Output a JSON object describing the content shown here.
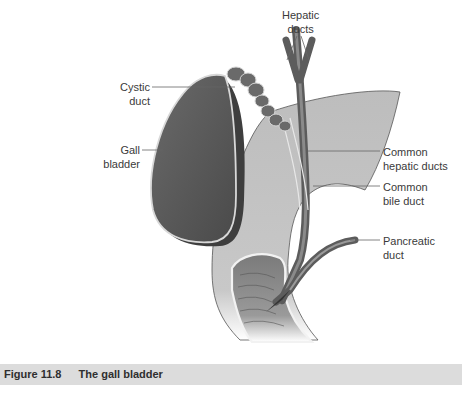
{
  "figure": {
    "labels": {
      "hepatic_ducts": [
        "Hepatic",
        "ducts"
      ],
      "cystic_duct": [
        "Cystic",
        "duct"
      ],
      "gall_bladder": [
        "Gall",
        "bladder"
      ],
      "common_hepatic_ducts": [
        "Common",
        "hepatic ducts"
      ],
      "common_bile_duct": [
        "Common",
        "bile duct"
      ],
      "pancreatic_duct": [
        "Pancreatic",
        "duct"
      ]
    },
    "colors": {
      "gallbladder": "#5a5a5a",
      "gallbladder_rim": "#d8d8d8",
      "duodenum": "#b8b8b8",
      "ducts": "#6e6e6e",
      "leader_lines": "#555555",
      "caption_bar": "#dcdcdc"
    }
  },
  "caption": {
    "number": "Figure 11.8",
    "title": "The gall bladder"
  }
}
